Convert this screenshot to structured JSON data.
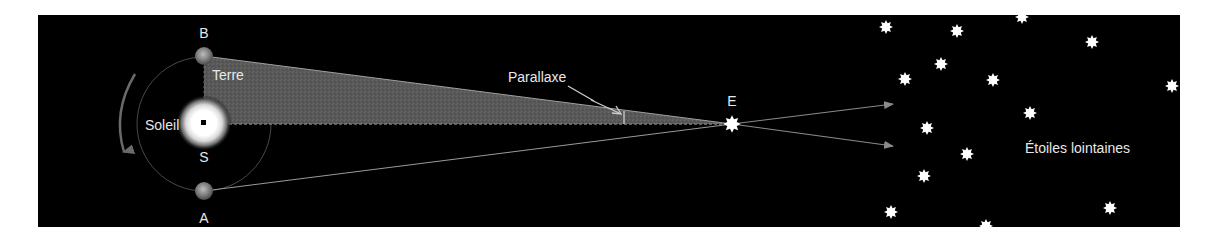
{
  "diagram": {
    "labels": {
      "b": "B",
      "a": "A",
      "s": "S",
      "e": "E",
      "earth": "Terre",
      "sun": "Soleil",
      "parallax": "Parallaxe",
      "distant_stars": "Étoiles lointaines"
    },
    "colors": {
      "background": "#000000",
      "page": "#ffffff",
      "triangle_fill": "#585858",
      "lines": "#9a9a9a",
      "text": "#e8e8e8",
      "star": "#ffffff",
      "orbit": "#5a5a5a",
      "rotation_arrow": "#6a6a6a"
    },
    "icons": {
      "sun": "sun-icon",
      "earth": "earth-icon",
      "star": "star-icon",
      "arrow": "arrow-icon"
    },
    "points": {
      "sun": [
        204,
        124
      ],
      "earth_b": [
        204,
        56
      ],
      "earth_a": [
        204,
        191
      ],
      "star_e": [
        732,
        124
      ]
    },
    "distant_stars": [
      [
        886,
        27
      ],
      [
        957,
        31
      ],
      [
        1022,
        17
      ],
      [
        1092,
        42
      ],
      [
        941,
        64
      ],
      [
        905,
        79
      ],
      [
        993,
        80
      ],
      [
        1172,
        86
      ],
      [
        1030,
        113
      ],
      [
        927,
        128
      ],
      [
        967,
        154
      ],
      [
        924,
        176
      ],
      [
        891,
        212
      ],
      [
        986,
        226
      ],
      [
        1110,
        208
      ]
    ]
  }
}
